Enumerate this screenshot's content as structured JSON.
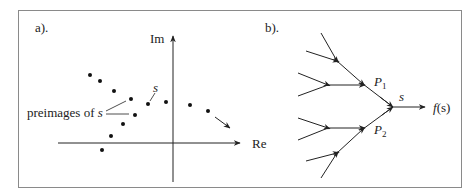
{
  "panel_a": {
    "label": "a).",
    "axis_im": "Im",
    "axis_re": "Re",
    "point_label": "s",
    "preimages_label_text": "preimages of ",
    "preimages_label_var": "s"
  },
  "panel_b": {
    "label": "b).",
    "node_p1": "P",
    "node_p1_sub": "1",
    "node_p2": "P",
    "node_p2_sub": "2",
    "node_s": "s",
    "output_f": "f",
    "output_arg": "(s)"
  },
  "colors": {
    "ink": "#222222",
    "border": "#8a8a8a"
  }
}
